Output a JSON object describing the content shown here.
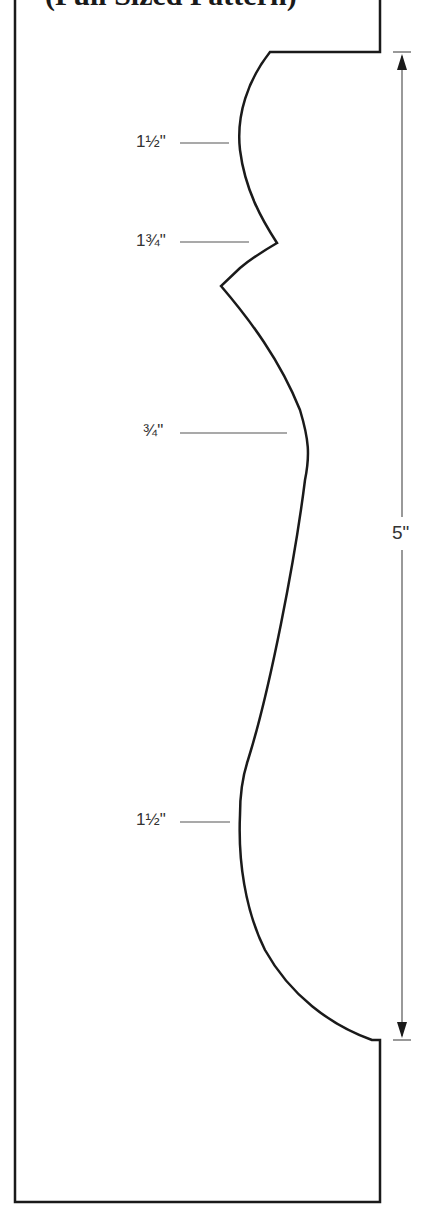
{
  "title": "(Full Sized Pattern)",
  "colors": {
    "outline": "#1a1a1a",
    "leader": "#555555",
    "dimension": "#555555",
    "text": "#333333"
  },
  "labels": [
    {
      "id": "radius-top",
      "text": "1½\"",
      "y": 143
    },
    {
      "id": "radius-point",
      "text": "1¾\"",
      "y": 242
    },
    {
      "id": "radius-middle",
      "text": "¾\"",
      "y": 433
    },
    {
      "id": "radius-bottom",
      "text": "1½\"",
      "y": 820
    }
  ],
  "dimension": {
    "text": "5\"",
    "from_y": 52,
    "to_y": 1040
  }
}
